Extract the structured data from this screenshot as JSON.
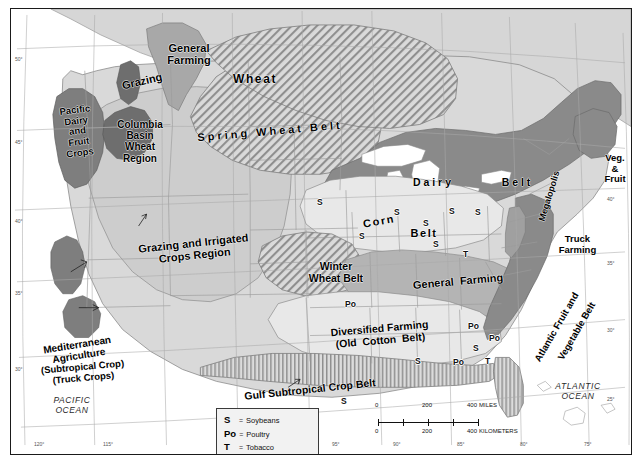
{
  "map": {
    "title": "Agricultural Regions of the United States",
    "regions": [
      {
        "name": "General Farming",
        "label": "General\nFarming",
        "x": 148,
        "y": 33,
        "w": 60,
        "size": 11,
        "rot": 0,
        "cls": ""
      },
      {
        "name": "Grazing",
        "label": "Grazing",
        "x": 100,
        "y": 66,
        "w": 62,
        "size": 11,
        "rot": -13,
        "cls": ""
      },
      {
        "name": "Wheat",
        "label": "Wheat",
        "x": 208,
        "y": 64,
        "w": 72,
        "size": 12,
        "rot": 0,
        "cls": "sp1"
      },
      {
        "name": "Spring Wheat Belt",
        "label": "Spring Wheat Belt",
        "x": 180,
        "y": 116,
        "w": 158,
        "size": 11,
        "rot": -5,
        "cls": "sp2"
      },
      {
        "name": "Pacific Dairy and Fruit Crops",
        "label": "Pacific\nDairy\nand\nFruit\nCrops",
        "x": 39,
        "y": 96,
        "w": 55,
        "size": 9.5,
        "rot": -7,
        "cls": ""
      },
      {
        "name": "Columbia Basin Wheat Region",
        "label": "Columbia\nBasin\nWheat\nRegion",
        "x": 100,
        "y": 110,
        "w": 58,
        "size": 10,
        "rot": 0,
        "cls": ""
      },
      {
        "name": "Dairy Belt",
        "label": "D a i r y",
        "x": 385,
        "y": 168,
        "w": 72,
        "size": 10.5,
        "rot": 0,
        "cls": ""
      },
      {
        "name": "Dairy Belt Right",
        "label": "B e l t",
        "x": 478,
        "y": 168,
        "w": 54,
        "size": 10.5,
        "rot": 0,
        "cls": ""
      },
      {
        "name": "Grazing and Irrigated Crops Region",
        "label": "Grazing and Irrigated\nCrops Region",
        "x": 118,
        "y": 228,
        "w": 130,
        "size": 11,
        "rot": -6,
        "cls": ""
      },
      {
        "name": "Corn Belt",
        "label": "Corn",
        "x": 343,
        "y": 206,
        "w": 50,
        "size": 11,
        "rot": -10,
        "cls": "sp1"
      },
      {
        "name": "Corn Belt Right",
        "label": "Belt",
        "x": 392,
        "y": 218,
        "w": 42,
        "size": 11,
        "rot": 0,
        "cls": "sp1"
      },
      {
        "name": "Winter Wheat Belt",
        "label": "Winter\nWheat Belt",
        "x": 290,
        "y": 252,
        "w": 70,
        "size": 10.5,
        "rot": 0,
        "cls": ""
      },
      {
        "name": "General Farming East",
        "label": "General  Farming",
        "x": 387,
        "y": 266,
        "w": 120,
        "size": 11,
        "rot": -5,
        "cls": ""
      },
      {
        "name": "Megalopolis",
        "label": "Megalopolis",
        "x": 507,
        "y": 182,
        "w": 62,
        "size": 9,
        "rot": -73,
        "cls": ""
      },
      {
        "name": "Veg. & Fruit",
        "label": "Veg.\n&\nFruit",
        "x": 586,
        "y": 144,
        "w": 36,
        "size": 9.5,
        "rot": 0,
        "cls": ""
      },
      {
        "name": "Truck Farming",
        "label": "Truck\nFarming",
        "x": 540,
        "y": 225,
        "w": 53,
        "size": 9.5,
        "rot": 0,
        "cls": ""
      },
      {
        "name": "Diversified Farming",
        "label": "Diversified Farming\n(Old  Cotton  Belt)",
        "x": 300,
        "y": 314,
        "w": 138,
        "size": 10.5,
        "rot": -5,
        "cls": ""
      },
      {
        "name": "Atlantic Fruit and Vegetable Belt",
        "label": "Atlantic Fruit and",
        "x": 504,
        "y": 313,
        "w": 84,
        "size": 9.5,
        "rot": -60,
        "cls": ""
      },
      {
        "name": "Atlantic Fruit and Vegetable Belt 2",
        "label": "Vegetable Belt",
        "x": 527,
        "y": 317,
        "w": 78,
        "size": 9.5,
        "rot": -60,
        "cls": ""
      },
      {
        "name": "Mediterranean Agriculture",
        "label": "Mediterranean\nAgriculture",
        "x": 19,
        "y": 330,
        "w": 96,
        "size": 10,
        "rot": -9,
        "cls": ""
      },
      {
        "name": "Mediterranean Subtitle",
        "label": "(Subtropical Crop)\n(Truck Crops)",
        "x": 20,
        "y": 353,
        "w": 104,
        "size": 9.5,
        "rot": -5,
        "cls": ""
      },
      {
        "name": "Gulf Subtropical Crop Belt",
        "label": "Gulf Subtropical Crop Belt",
        "x": 210,
        "y": 375,
        "w": 178,
        "size": 10.5,
        "rot": -6,
        "cls": ""
      }
    ],
    "oceans": [
      {
        "name": "Pacific Ocean",
        "label": "PACIFIC\nOCEAN",
        "x": 30,
        "y": 387,
        "w": 62,
        "size": 8.5
      },
      {
        "name": "Atlantic Ocean",
        "label": "ATLANTIC\nOCEAN",
        "x": 534,
        "y": 373,
        "w": 66,
        "size": 8.5
      }
    ],
    "point_markers": [
      {
        "symbol": "S",
        "x": 306,
        "y": 188
      },
      {
        "symbol": "S",
        "x": 383,
        "y": 198
      },
      {
        "symbol": "S",
        "x": 438,
        "y": 197
      },
      {
        "symbol": "S",
        "x": 464,
        "y": 198
      },
      {
        "symbol": "S",
        "x": 412,
        "y": 209
      },
      {
        "symbol": "S",
        "x": 348,
        "y": 222
      },
      {
        "symbol": "S",
        "x": 422,
        "y": 230
      },
      {
        "symbol": "T",
        "x": 452,
        "y": 240
      },
      {
        "symbol": "Po",
        "x": 334,
        "y": 290
      },
      {
        "symbol": "Po",
        "x": 457,
        "y": 312
      },
      {
        "symbol": "Po",
        "x": 478,
        "y": 324
      },
      {
        "symbol": "S",
        "x": 462,
        "y": 334
      },
      {
        "symbol": "S",
        "x": 404,
        "y": 347
      },
      {
        "symbol": "Po",
        "x": 442,
        "y": 348
      },
      {
        "symbol": "T",
        "x": 474,
        "y": 347
      },
      {
        "symbol": "S",
        "x": 330,
        "y": 387
      }
    ],
    "legend": {
      "name": "symbol-legend",
      "equals": "=",
      "entries": [
        {
          "key": "S",
          "value": "Soybeans"
        },
        {
          "key": "Po",
          "value": "Poultry"
        },
        {
          "key": "T",
          "value": "Tobacco"
        }
      ]
    },
    "scale_bar": {
      "miles": {
        "ticks": [
          "0",
          "200",
          "400"
        ],
        "unit": "MILES"
      },
      "kilometers": {
        "ticks": [
          "0",
          "200",
          "400"
        ],
        "unit": "KILOMETERS"
      }
    },
    "graticule": {
      "latitude_left": [
        {
          "v": "50°",
          "y": 47
        },
        {
          "v": "45°",
          "y": 130
        },
        {
          "v": "40°",
          "y": 209
        },
        {
          "v": "35°",
          "y": 281
        },
        {
          "v": "30°",
          "y": 357
        }
      ],
      "latitude_right": [
        {
          "v": "40°",
          "y": 187
        },
        {
          "v": "35°",
          "y": 251
        },
        {
          "v": "30°",
          "y": 318
        },
        {
          "v": "25°",
          "y": 387
        }
      ],
      "longitude_bottom": [
        {
          "v": "120°",
          "x": 23
        },
        {
          "v": "115°",
          "x": 92
        },
        {
          "v": "95°",
          "x": 321
        },
        {
          "v": "90°",
          "x": 382
        },
        {
          "v": "85°",
          "x": 446
        },
        {
          "v": "80°",
          "x": 509
        },
        {
          "v": "75°",
          "x": 573
        }
      ]
    },
    "colors": {
      "land_light": "#d9d9d9",
      "land_mid": "#c2c2c2",
      "region_dark": "#8a8a8a",
      "region_darker": "#6e6e6e",
      "water": "#ffffff",
      "border": "#7d7d7d",
      "frame": "#1a1a1a",
      "hatch": "#6a6a6a"
    }
  }
}
